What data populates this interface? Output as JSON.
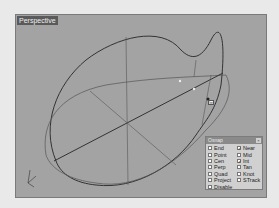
{
  "viewport": {
    "title": "Perspective",
    "background": "#a3a3a3"
  },
  "cursor_tooltip": "Int",
  "gizmo": {
    "axes": [
      "x",
      "y",
      "z"
    ]
  },
  "osnap_panel": {
    "title": "Osnap",
    "close_label": "×",
    "items": [
      {
        "label": "End",
        "checked": false
      },
      {
        "label": "Near",
        "checked": true
      },
      {
        "label": "Point",
        "checked": false
      },
      {
        "label": "Mid",
        "checked": false
      },
      {
        "label": "Cen",
        "checked": false
      },
      {
        "label": "Int",
        "checked": true
      },
      {
        "label": "Perp",
        "checked": false
      },
      {
        "label": "Tan",
        "checked": false
      },
      {
        "label": "Quad",
        "checked": false
      },
      {
        "label": "Knot",
        "checked": false
      },
      {
        "label": "Project",
        "checked": false
      },
      {
        "label": "STrack",
        "checked": false
      },
      {
        "label": "Disable",
        "checked": false
      }
    ],
    "check_mark": "✓"
  }
}
